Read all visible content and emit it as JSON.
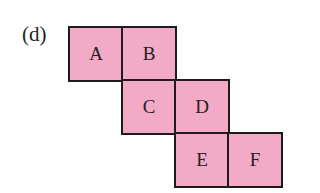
{
  "figure": {
    "label": "(d)",
    "fill_color": "#f3aac7",
    "border_color": "#1f1a1c",
    "squares": [
      {
        "letter": "A",
        "x": 68,
        "y": 26
      },
      {
        "letter": "B",
        "x": 121,
        "y": 26
      },
      {
        "letter": "C",
        "x": 121,
        "y": 79
      },
      {
        "letter": "D",
        "x": 174,
        "y": 79
      },
      {
        "letter": "E",
        "x": 174,
        "y": 132
      },
      {
        "letter": "F",
        "x": 227,
        "y": 132
      }
    ]
  }
}
